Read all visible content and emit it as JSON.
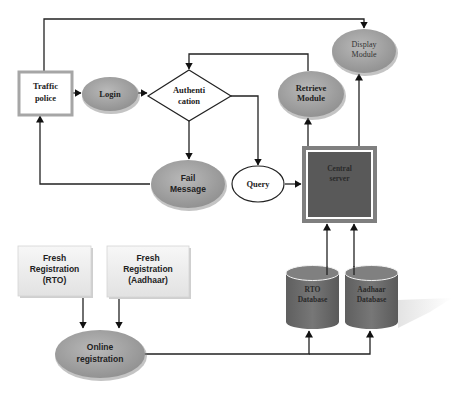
{
  "diagram": {
    "nodes": {
      "traffic_police": {
        "line1": "Traffic",
        "line2": "police",
        "shape": "rectangle"
      },
      "login": {
        "label": "Login",
        "shape": "ellipse"
      },
      "authentication": {
        "line1": "Authenti",
        "line2": "cation",
        "shape": "diamond"
      },
      "fail_message": {
        "line1": "Fail",
        "line2": "Message",
        "shape": "ellipse"
      },
      "query": {
        "label": "Query",
        "shape": "ellipse"
      },
      "retrieve_module": {
        "line1": "Retrieve",
        "line2": "Module",
        "shape": "ellipse"
      },
      "display_module": {
        "line1": "Display",
        "line2": "Module",
        "shape": "ellipse"
      },
      "central_server": {
        "line1": "Central",
        "line2": "server",
        "shape": "rectangle"
      },
      "fresh_reg_rto": {
        "line1": "Fresh",
        "line2": "Registration",
        "line3": "(RTO)",
        "shape": "rectangle"
      },
      "fresh_reg_aadhaar": {
        "line1": "Fresh",
        "line2": "Registration",
        "line3": "(Aadhaar)",
        "shape": "rectangle"
      },
      "online_registration": {
        "line1": "Online",
        "line2": "registration",
        "shape": "ellipse"
      },
      "rto_database": {
        "line1": "RTO",
        "line2": "Database",
        "shape": "cylinder"
      },
      "aadhaar_database": {
        "line1": "Aadhaar",
        "line2": "Database",
        "shape": "cylinder"
      }
    },
    "edges": [
      {
        "from": "traffic_police",
        "to": "login"
      },
      {
        "from": "login",
        "to": "authentication"
      },
      {
        "from": "authentication",
        "to": "fail_message"
      },
      {
        "from": "authentication",
        "to": "query"
      },
      {
        "from": "fail_message",
        "to": "traffic_police"
      },
      {
        "from": "query",
        "to": "central_server"
      },
      {
        "from": "central_server",
        "to": "retrieve_module"
      },
      {
        "from": "central_server",
        "to": "display_module"
      },
      {
        "from": "retrieve_module",
        "to": "authentication"
      },
      {
        "from": "traffic_police",
        "to": "display_module"
      },
      {
        "from": "fresh_reg_rto",
        "to": "online_registration"
      },
      {
        "from": "fresh_reg_aadhaar",
        "to": "online_registration"
      },
      {
        "from": "online_registration",
        "to": "rto_database"
      },
      {
        "from": "online_registration",
        "to": "aadhaar_database"
      },
      {
        "from": "rto_database",
        "to": "central_server"
      },
      {
        "from": "aadhaar_database",
        "to": "central_server"
      }
    ],
    "colors": {
      "ellipse_fill": "#a6a6a6",
      "server_fill": "#595959",
      "server_border": "#7f7f7f",
      "cylinder_fill": "#707070",
      "traffic_border": "#a6a6a6",
      "registration_fill": "#eeeeee"
    }
  }
}
